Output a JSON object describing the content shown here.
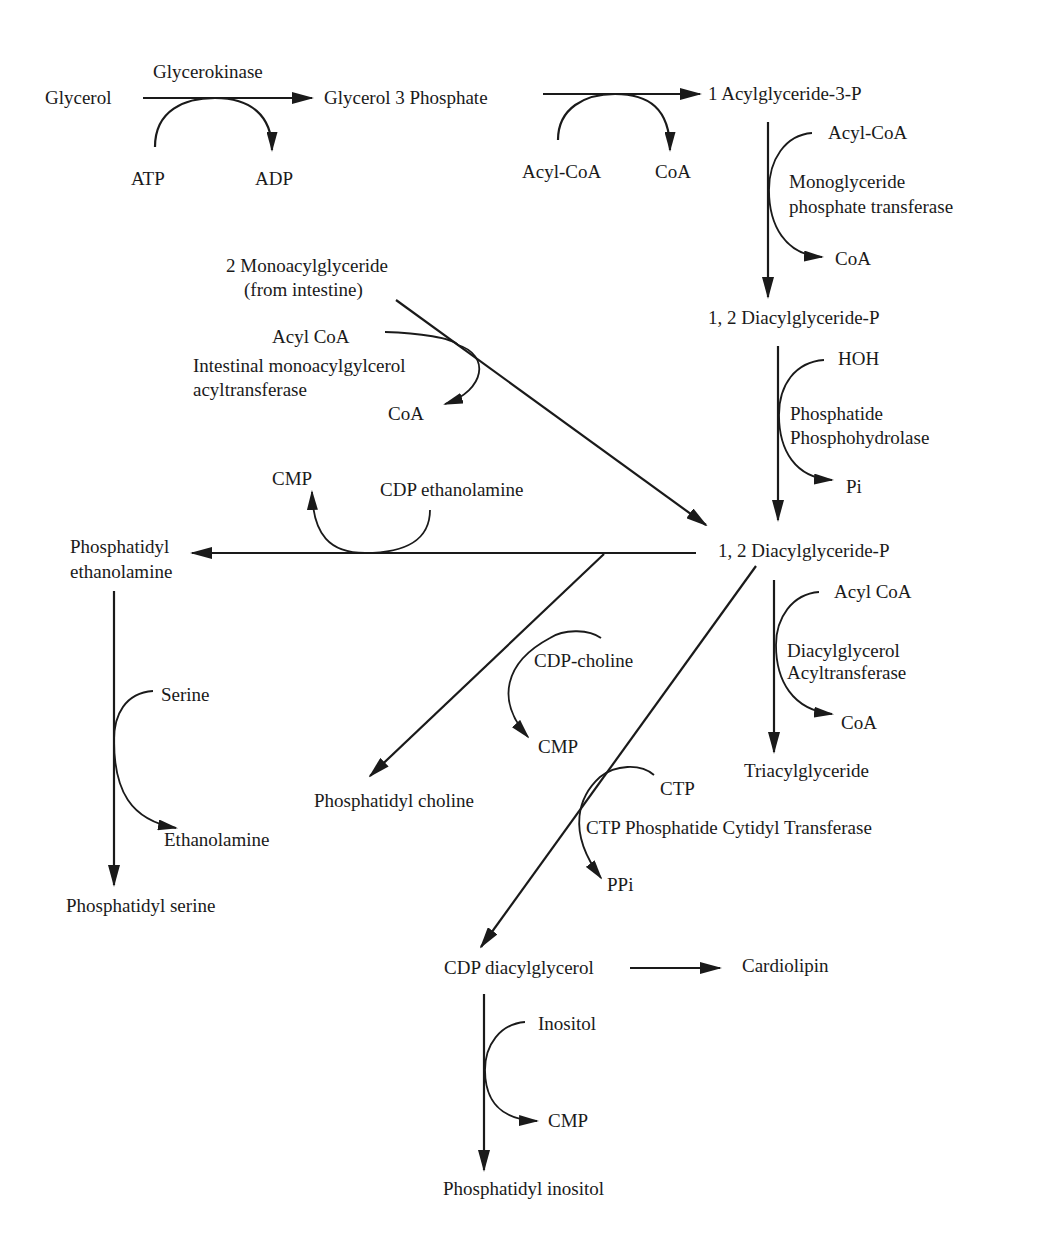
{
  "diagram": {
    "nodes": {
      "glycerol": "Glycerol",
      "glycerol_3_phosphate": "Glycerol 3 Phosphate",
      "acylglyceride_3p": "1 Acylglyceride-3-P",
      "diacylglyceride_p_1": "1, 2 Diacylglyceride-P",
      "diacylglyceride_p_2": "1, 2 Diacylglyceride-P",
      "monoacylglyceride_line1": "2 Monoacylglyceride",
      "monoacylglyceride_line2": "(from intestine)",
      "phosphatidyl_ethanolamine_line1": "Phosphatidyl",
      "phosphatidyl_ethanolamine_line2": "ethanolamine",
      "phosphatidyl_serine": "Phosphatidyl serine",
      "phosphatidyl_choline": "Phosphatidyl choline",
      "triacylglyceride": "Triacylglyceride",
      "cdp_diacylglycerol": "CDP diacylglycerol",
      "cardiolipin": "Cardiolipin",
      "phosphatidyl_inositol": "Phosphatidyl inositol"
    },
    "enzymes": {
      "glycerokinase": "Glycerokinase",
      "mgpt_line1": "Monoglyceride",
      "mgpt_line2": "phosphate transferase",
      "imat_line1": "Intestinal monoacylgylcerol",
      "imat_line2": "acyltransferase",
      "pph_line1": "Phosphatide",
      "pph_line2": "Phosphohydrolase",
      "dgat_line1": "Diacylglycerol",
      "dgat_line2": "Acyltransferase",
      "ctp_pct": "CTP Phosphatide Cytidyl Transferase"
    },
    "cofactors": {
      "atp": "ATP",
      "adp": "ADP",
      "acyl_coa_1": "Acyl-CoA",
      "coa_1": "CoA",
      "acyl_coa_2": "Acyl-CoA",
      "coa_2": "CoA",
      "acyl_coa_3": "Acyl CoA",
      "coa_3": "CoA",
      "hoh": "HOH",
      "pi": "Pi",
      "cmp_1": "CMP",
      "cdp_ethanolamine": "CDP ethanolamine",
      "acyl_coa_4": "Acyl CoA",
      "coa_4": "CoA",
      "serine": "Serine",
      "ethanolamine": "Ethanolamine",
      "cdp_choline": "CDP-choline",
      "cmp_2": "CMP",
      "ctp": "CTP",
      "ppi": "PPi",
      "inositol": "Inositol",
      "cmp_3": "CMP"
    },
    "colors": {
      "line": "#1a1a1a",
      "background": "#ffffff"
    }
  }
}
